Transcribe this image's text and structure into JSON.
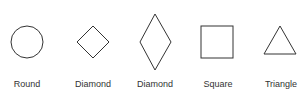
{
  "shapes": [
    {
      "type": "circle",
      "label": "Round"
    },
    {
      "type": "diamond",
      "label": "Diamond"
    },
    {
      "type": "tall-diamond",
      "label": "Diamond"
    },
    {
      "type": "square",
      "label": "Square"
    },
    {
      "type": "triangle",
      "label": "Triangle"
    }
  ],
  "stroke_color": "#333333"
}
